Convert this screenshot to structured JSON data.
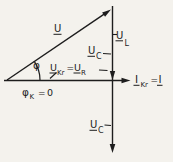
{
  "colors": {
    "ink": "#1d1d1d",
    "paper": "#f4f2ed"
  },
  "labels": {
    "u": {
      "symbol": "U"
    },
    "phi": {
      "symbol": "φ"
    },
    "u_kr_eq_u_r": {
      "u1": "U",
      "sub1": "Kr",
      "eq": "=",
      "u2": "U",
      "sub2": "R"
    },
    "phi_k": {
      "symbol": "φ",
      "sub": "K",
      "eq": "=",
      "value": "0"
    },
    "u_l": {
      "symbol": "U",
      "sub": "L"
    },
    "u_c_upper": {
      "symbol": "U",
      "sub": "C"
    },
    "u_c_lower": {
      "symbol": "U",
      "sub": "C"
    },
    "i_kr_eq_i": {
      "i1": "I",
      "sub1": "Kr",
      "eq": "=",
      "i2": "I"
    }
  }
}
